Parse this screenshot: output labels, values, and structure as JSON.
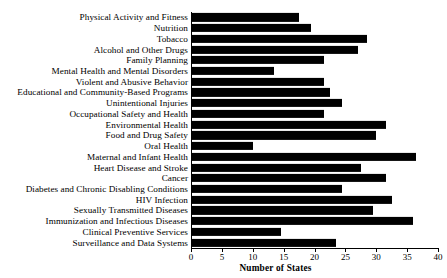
{
  "chart_data": {
    "type": "bar",
    "orientation": "horizontal",
    "title": "",
    "xlabel": "Number of States",
    "ylabel": "",
    "xlim": [
      0,
      40
    ],
    "xticks": [
      0,
      5,
      10,
      15,
      20,
      25,
      30,
      35,
      40
    ],
    "grid": false,
    "legend": false,
    "bar_color": "#000000",
    "categories": [
      "Physical Activity and Fitness",
      "Nutrition",
      "Tobacco",
      "Alcohol and Other Drugs",
      "Family Planning",
      "Mental Health and Mental Disorders",
      "Violent and Abusive Behavior",
      "Educational and Community-Based Programs",
      "Unintentional Injuries",
      "Occupational Safety and Health",
      "Environmental Health",
      "Food and Drug Safety",
      "Oral Health",
      "Maternal and Infant Health",
      "Heart Disease and Stroke",
      "Cancer",
      "Diabetes and Chronic Disabling Conditions",
      "HIV Infection",
      "Sexually Transmitted Diseases",
      "Immunization and Infectious Diseases",
      "Clinical Preventive Services",
      "Surveillance and Data Systems"
    ],
    "values": [
      17.5,
      19.5,
      28.5,
      27,
      21.5,
      13.5,
      21.5,
      22.5,
      24.5,
      21.5,
      31.5,
      30,
      10,
      36.5,
      27.5,
      31.5,
      24.5,
      32.5,
      29.5,
      36,
      14.5,
      23.5
    ]
  }
}
